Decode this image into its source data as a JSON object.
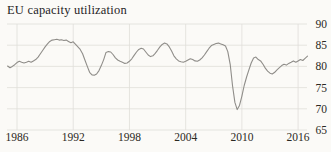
{
  "chart_data": {
    "type": "line",
    "title": "EU capacity utilization",
    "series_name": "EU capacity utilization (%)",
    "x_start": 1985.0,
    "x_step": 0.25,
    "values": [
      80.1,
      79.7,
      80.0,
      80.4,
      80.9,
      81.2,
      81.0,
      80.8,
      81.0,
      81.2,
      81.0,
      81.3,
      81.6,
      82.2,
      83.0,
      83.8,
      84.6,
      85.3,
      85.9,
      86.2,
      86.3,
      86.4,
      86.2,
      86.3,
      86.1,
      86.2,
      85.9,
      85.6,
      85.8,
      85.2,
      84.6,
      84.0,
      83.0,
      81.5,
      80.0,
      78.6,
      78.0,
      77.9,
      78.2,
      79.0,
      80.2,
      81.6,
      83.3,
      83.5,
      83.4,
      82.8,
      82.0,
      81.5,
      81.2,
      81.0,
      80.7,
      80.8,
      81.2,
      81.8,
      82.6,
      83.4,
      84.0,
      84.3,
      84.1,
      83.4,
      82.7,
      82.3,
      82.5,
      83.1,
      83.8,
      84.6,
      85.2,
      85.5,
      85.3,
      84.6,
      83.6,
      82.5,
      81.8,
      81.3,
      81.1,
      81.0,
      81.2,
      81.5,
      81.8,
      81.6,
      81.3,
      81.2,
      81.5,
      82.0,
      82.7,
      83.5,
      84.3,
      84.9,
      85.2,
      85.4,
      85.5,
      85.3,
      85.1,
      84.8,
      83.5,
      80.5,
      75.5,
      71.5,
      69.8,
      70.8,
      73.0,
      75.5,
      77.5,
      79.2,
      80.8,
      82.0,
      82.2,
      81.6,
      81.3,
      80.5,
      79.6,
      78.9,
      78.4,
      78.2,
      78.6,
      79.2,
      79.7,
      80.2,
      80.5,
      80.3,
      80.7,
      81.0,
      81.3,
      81.0,
      81.3,
      81.6,
      81.4,
      81.9,
      82.4
    ],
    "xticks": [
      1986,
      1992,
      1998,
      2004,
      2010,
      2016
    ],
    "yticks": [
      65,
      70,
      75,
      80,
      85,
      90
    ],
    "ylim": [
      65,
      90
    ],
    "xlim": [
      1985,
      2018
    ],
    "grid": true,
    "legend": "none",
    "y_axis_side": "right",
    "line_color": "#8f8d89",
    "grid_color": "#e0ded9",
    "text_color": "#2b2923",
    "background_color": "#fbfaf7"
  }
}
